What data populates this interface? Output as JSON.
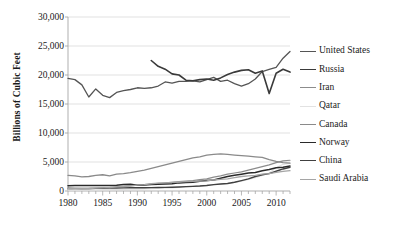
{
  "chart_data": {
    "type": "line",
    "title": "",
    "xlabel": "",
    "ylabel": "Billions of Cubic Feet",
    "xlim": [
      1980,
      2012
    ],
    "ylim": [
      0,
      30000
    ],
    "grid": true,
    "legend_position": "right",
    "y_ticks": [
      {
        "value": 30000,
        "label": "30,000"
      },
      {
        "value": 25000,
        "label": "25,000"
      },
      {
        "value": 20000,
        "label": "20,000"
      },
      {
        "value": 15000,
        "label": "15,000"
      },
      {
        "value": 10000,
        "label": "10,000"
      },
      {
        "value": 5000,
        "label": "5,000"
      },
      {
        "value": 0,
        "label": "0"
      }
    ],
    "x_ticks": [
      {
        "value": 1980,
        "label": "1980"
      },
      {
        "value": 1985,
        "label": "1985"
      },
      {
        "value": 1990,
        "label": "1990"
      },
      {
        "value": 1995,
        "label": "1995"
      },
      {
        "value": 2000,
        "label": "2000"
      },
      {
        "value": 2005,
        "label": "2005"
      },
      {
        "value": 2010,
        "label": "2010"
      }
    ],
    "x_minor_tick_interval": 1,
    "series": [
      {
        "name": "United States",
        "color": "#555555",
        "width": 1.3,
        "x": [
          1980,
          1981,
          1982,
          1983,
          1984,
          1985,
          1986,
          1987,
          1988,
          1989,
          1990,
          1991,
          1992,
          1993,
          1994,
          1995,
          1996,
          1997,
          1998,
          1999,
          2000,
          2001,
          2002,
          2003,
          2004,
          2005,
          2006,
          2007,
          2008,
          2009,
          2010,
          2011,
          2012
        ],
        "values": [
          19400,
          19200,
          18300,
          16200,
          17600,
          16500,
          16100,
          17000,
          17300,
          17500,
          17800,
          17700,
          17800,
          18100,
          18800,
          18600,
          18900,
          18900,
          19000,
          18800,
          19200,
          19600,
          18900,
          19100,
          18500,
          18100,
          18500,
          19300,
          20600,
          20960,
          21320,
          22900,
          24060
        ]
      },
      {
        "name": "Russia",
        "color": "#3a3a3a",
        "width": 1.6,
        "x": [
          1992,
          1993,
          1994,
          1995,
          1996,
          1997,
          1998,
          1999,
          2000,
          2001,
          2002,
          2003,
          2004,
          2005,
          2006,
          2007,
          2008,
          2009,
          2010,
          2011,
          2012
        ],
        "values": [
          22500,
          21500,
          21000,
          20200,
          20000,
          19100,
          19000,
          19200,
          19300,
          19100,
          19500,
          20100,
          20500,
          20800,
          20900,
          20300,
          20700,
          16800,
          20300,
          21000,
          20500
        ]
      },
      {
        "name": "Iran",
        "color": "#8c8c8c",
        "width": 1.2,
        "x": [
          1980,
          1981,
          1982,
          1983,
          1984,
          1985,
          1986,
          1987,
          1988,
          1989,
          1990,
          1991,
          1992,
          1993,
          1994,
          1995,
          1996,
          1997,
          1998,
          1999,
          2000,
          2001,
          2002,
          2003,
          2004,
          2005,
          2006,
          2007,
          2008,
          2009,
          2010,
          2011,
          2012
        ],
        "values": [
          250,
          300,
          350,
          400,
          450,
          500,
          600,
          700,
          800,
          900,
          1000,
          1100,
          1200,
          1300,
          1400,
          1500,
          1600,
          1700,
          1800,
          1950,
          2100,
          2400,
          2600,
          2900,
          3100,
          3300,
          3600,
          3900,
          4200,
          4500,
          4900,
          5200,
          5300
        ]
      },
      {
        "name": "Qatar",
        "color": "#e2e2e2",
        "width": 1.2,
        "x": [
          1980,
          1981,
          1982,
          1983,
          1984,
          1985,
          1986,
          1987,
          1988,
          1989,
          1990,
          1991,
          1992,
          1993,
          1994,
          1995,
          1996,
          1997,
          1998,
          1999,
          2000,
          2001,
          2002,
          2003,
          2004,
          2005,
          2006,
          2007,
          2008,
          2009,
          2010,
          2011,
          2012
        ],
        "values": [
          150,
          160,
          170,
          180,
          200,
          220,
          240,
          260,
          280,
          300,
          330,
          360,
          400,
          450,
          500,
          550,
          600,
          700,
          800,
          900,
          1000,
          1100,
          1200,
          1300,
          1500,
          1700,
          2000,
          2300,
          2700,
          3100,
          4000,
          4600,
          4800
        ]
      },
      {
        "name": "Canada",
        "color": "#8a8a8a",
        "width": 1.3,
        "x": [
          1980,
          1981,
          1982,
          1983,
          1984,
          1985,
          1986,
          1987,
          1988,
          1989,
          1990,
          1991,
          1992,
          1993,
          1994,
          1995,
          1996,
          1997,
          1998,
          1999,
          2000,
          2001,
          2002,
          2003,
          2004,
          2005,
          2006,
          2007,
          2008,
          2009,
          2010,
          2011,
          2012
        ],
        "values": [
          2700,
          2600,
          2450,
          2500,
          2700,
          2800,
          2600,
          2900,
          3000,
          3150,
          3400,
          3600,
          3900,
          4200,
          4500,
          4800,
          5100,
          5400,
          5700,
          5900,
          6200,
          6300,
          6400,
          6300,
          6200,
          6100,
          6000,
          5900,
          5800,
          5400,
          5100,
          4900,
          4800
        ]
      },
      {
        "name": "Norway",
        "color": "#2a2a2a",
        "width": 1.5,
        "x": [
          1980,
          1981,
          1982,
          1983,
          1984,
          1985,
          1986,
          1987,
          1988,
          1989,
          1990,
          1991,
          1992,
          1993,
          1994,
          1995,
          1996,
          1997,
          1998,
          1999,
          2000,
          2001,
          2002,
          2003,
          2004,
          2005,
          2006,
          2007,
          2008,
          2009,
          2010,
          2011,
          2012
        ],
        "values": [
          900,
          950,
          950,
          950,
          950,
          950,
          950,
          1000,
          1100,
          1150,
          1000,
          1050,
          1100,
          1150,
          1200,
          1250,
          1400,
          1450,
          1500,
          1700,
          1800,
          1900,
          2200,
          2500,
          2700,
          2900,
          3100,
          3200,
          3500,
          3700,
          4000,
          4100,
          4300
        ]
      },
      {
        "name": "China",
        "color": "#404040",
        "width": 1.4,
        "x": [
          1980,
          1981,
          1982,
          1983,
          1984,
          1985,
          1986,
          1987,
          1988,
          1989,
          1990,
          1991,
          1992,
          1993,
          1994,
          1995,
          1996,
          1997,
          1998,
          1999,
          2000,
          2001,
          2002,
          2003,
          2004,
          2005,
          2006,
          2007,
          2008,
          2009,
          2010,
          2011,
          2012
        ],
        "values": [
          500,
          450,
          430,
          430,
          450,
          470,
          500,
          520,
          540,
          560,
          560,
          570,
          580,
          600,
          620,
          650,
          700,
          750,
          800,
          850,
          950,
          1100,
          1200,
          1300,
          1500,
          1800,
          2100,
          2500,
          2800,
          3000,
          3400,
          3800,
          4100
        ]
      },
      {
        "name": "Saudi Arabia",
        "color": "#a5a5a5",
        "width": 1.3,
        "x": [
          1980,
          1981,
          1982,
          1983,
          1984,
          1985,
          1986,
          1987,
          1988,
          1989,
          1990,
          1991,
          1992,
          1993,
          1994,
          1995,
          1996,
          1997,
          1998,
          1999,
          2000,
          2001,
          2002,
          2003,
          2004,
          2005,
          2006,
          2007,
          2008,
          2009,
          2010,
          2011,
          2012
        ],
        "values": [
          450,
          430,
          420,
          430,
          500,
          550,
          600,
          700,
          800,
          900,
          1000,
          1100,
          1250,
          1350,
          1400,
          1500,
          1550,
          1600,
          1650,
          1700,
          1750,
          1900,
          2000,
          2100,
          2300,
          2500,
          2600,
          2700,
          2900,
          3000,
          3200,
          3400,
          3500
        ]
      }
    ]
  },
  "legend": {
    "items": [
      {
        "label": "United States"
      },
      {
        "label": "Russia"
      },
      {
        "label": "Iran"
      },
      {
        "label": "Qatar"
      },
      {
        "label": "Canada"
      },
      {
        "label": "Norway"
      },
      {
        "label": "China"
      },
      {
        "label": "Saudi Arabia"
      }
    ]
  },
  "style": {
    "grid_color": "#d9d9d9",
    "axis_color": "#a6a6a6",
    "text_color": "#1a1a1a",
    "background": "#ffffff"
  }
}
